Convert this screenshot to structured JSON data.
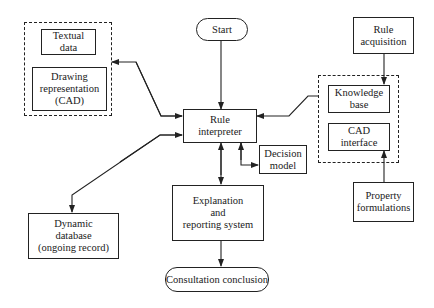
{
  "nodes": {
    "start": "Start",
    "textual_data": "Textual\ndata",
    "drawing_representation": "Drawing\nrepresentation\n(CAD)",
    "rule_interpreter": "Rule\ninterpreter",
    "rule_acquisition": "Rule\nacquisition",
    "knowledge_base": "Knowledge\nbase",
    "cad_interface": "CAD\ninterface",
    "decision_model": "Decision\nmodel",
    "explanation": "Explanation\nand\nreporting system",
    "property_formulations": "Property\nformulations",
    "dynamic_database": "Dynamic\ndatabase\n(ongoing record)",
    "consultation_conclusion": "Consultation conclusion"
  },
  "edges": [
    {
      "from": "start",
      "to": "rule_interpreter"
    },
    {
      "from": "rule_interpreter",
      "to": "left_group",
      "bidirectional": true
    },
    {
      "from": "right_group",
      "to": "rule_interpreter"
    },
    {
      "from": "rule_acquisition",
      "to": "knowledge_base"
    },
    {
      "from": "property_formulations",
      "to": "cad_interface"
    },
    {
      "from": "rule_interpreter",
      "to": "decision_model",
      "bidirectional": true
    },
    {
      "from": "rule_interpreter",
      "to": "explanation",
      "bidirectional": true
    },
    {
      "from": "rule_interpreter",
      "to": "dynamic_database",
      "bidirectional": true
    },
    {
      "from": "explanation",
      "to": "consultation_conclusion"
    }
  ]
}
